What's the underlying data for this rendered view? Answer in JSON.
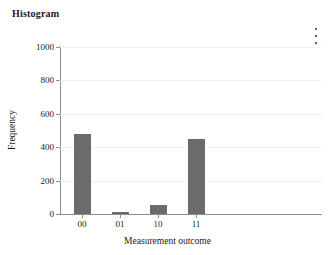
{
  "header": {
    "title": "Histogram",
    "menu_icon": "kebab-menu-icon"
  },
  "chart_data": {
    "type": "bar",
    "title": "Histogram",
    "xlabel": "Measurement outcome",
    "ylabel": "Frequency",
    "categories": [
      "00",
      "01",
      "10",
      "11"
    ],
    "values": [
      480,
      15,
      55,
      450
    ],
    "ylim": [
      0,
      1000
    ],
    "y_ticks": [
      0,
      200,
      400,
      600,
      800,
      1000
    ],
    "y_tick_labels": [
      "0",
      "200",
      "400",
      "600",
      "800",
      "1000"
    ],
    "grid": true,
    "legend": false,
    "bar_color": "#6b6b6b",
    "grid_color": "#f0f0f0",
    "axis_color": "#8e8e8e"
  }
}
